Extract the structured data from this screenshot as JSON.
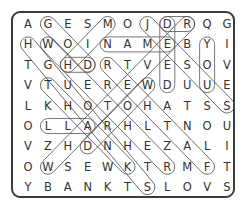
{
  "puzzle": {
    "rows": [
      [
        "A",
        "G",
        "E",
        "S",
        "M",
        "O",
        "J",
        "D",
        "R",
        "Q",
        "G"
      ],
      [
        "H",
        "W",
        "O",
        "I",
        "N",
        "A",
        "M",
        "E",
        "B",
        "Y",
        "I"
      ],
      [
        "T",
        "G",
        "H",
        "D",
        "R",
        "T",
        "V",
        "E",
        "S",
        "O",
        "V"
      ],
      [
        "V",
        "T",
        "U",
        "E",
        "R",
        "E",
        "W",
        "D",
        "U",
        "U",
        "E"
      ],
      [
        "L",
        "K",
        "H",
        "O",
        "T",
        "O",
        "H",
        "A",
        "T",
        "S",
        "S"
      ],
      [
        "O",
        "L",
        "L",
        "A",
        "R",
        "H",
        "L",
        "T",
        "N",
        "O",
        "U"
      ],
      [
        "V",
        "Z",
        "H",
        "D",
        "N",
        "H",
        "E",
        "Z",
        "A",
        "L",
        "I"
      ],
      [
        "O",
        "W",
        "S",
        "E",
        "W",
        "K",
        "T",
        "R",
        "M",
        "F",
        "T"
      ],
      [
        "Y",
        "B",
        "A",
        "N",
        "K",
        "T",
        "S",
        "L",
        "O",
        "V",
        "S"
      ]
    ],
    "found_words": [
      {
        "word": "NAME",
        "from": [
          1,
          4
        ],
        "to": [
          1,
          7
        ]
      },
      {
        "word": "DEED",
        "from": [
          0,
          7
        ],
        "to": [
          3,
          7
        ]
      },
      {
        "word": "YOU",
        "from": [
          1,
          9
        ],
        "to": [
          3,
          9
        ]
      },
      {
        "word": "HD",
        "from": [
          2,
          2
        ],
        "to": [
          2,
          3
        ]
      },
      {
        "word": "ALL",
        "from": [
          5,
          3
        ],
        "to": [
          5,
          1
        ]
      },
      {
        "word": "GOD",
        "from": [
          0,
          1
        ],
        "to": [
          2,
          3
        ]
      },
      {
        "word": "WHETHER",
        "from": [
          1,
          1
        ],
        "to": [
          7,
          7
        ]
      },
      {
        "word": "THANK",
        "from": [
          3,
          1
        ],
        "to": [
          7,
          5
        ]
      },
      {
        "word": "FATHER",
        "from": [
          7,
          9
        ],
        "to": [
          2,
          4
        ]
      },
      {
        "word": "JESUS",
        "from": [
          0,
          6
        ],
        "to": [
          4,
          10
        ]
      },
      {
        "word": "WHATEVER",
        "from": [
          7,
          1
        ],
        "to": [
          0,
          8
        ]
      },
      {
        "word": "WORD",
        "from": [
          3,
          6
        ],
        "to": [
          6,
          3
        ]
      },
      {
        "word": "HIM",
        "from": [
          2,
          2
        ],
        "to": [
          0,
          4
        ]
      },
      {
        "word": "HOURS",
        "from": [
          1,
          0
        ],
        "to": [
          8,
          6
        ]
      },
      {
        "word": "DR",
        "from": [
          0,
          7
        ],
        "to": [
          0,
          8
        ]
      }
    ]
  }
}
